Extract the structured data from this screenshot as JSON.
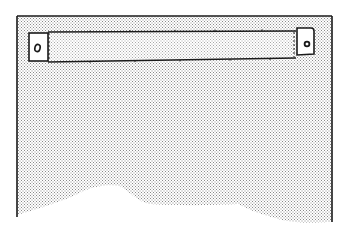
{
  "figure": {
    "type": "technical-line-illustration",
    "colors": {
      "background": "#ffffff",
      "ink": "#1a1a1a",
      "stipple": "#9a9a9a",
      "tab_fill": "#ffffff"
    },
    "panel": {
      "label": "panel",
      "left": 17,
      "top": 16,
      "right": 332
    },
    "strip": {
      "label": "strip",
      "x1": 48,
      "y1": 32,
      "x2": 296,
      "y2": 62
    },
    "tabs": [
      {
        "label": "left-tab",
        "glyph": "o",
        "x": 29,
        "y": 33,
        "w": 19,
        "h": 28
      },
      {
        "label": "right-tab",
        "glyph": "•",
        "x": 297,
        "y": 28,
        "w": 17,
        "h": 27
      }
    ]
  }
}
